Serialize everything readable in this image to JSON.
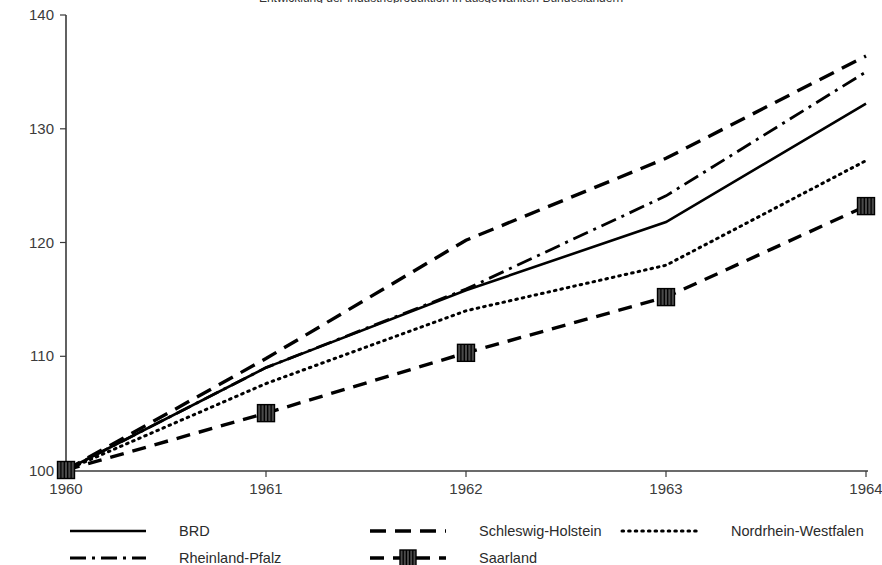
{
  "chart_data": {
    "type": "line",
    "title": "Entwicklung der Industrieproduktion in ausgewählten Bundesländern",
    "xlabel": "",
    "ylabel": "",
    "x": [
      1960,
      1961,
      1962,
      1963,
      1964
    ],
    "categories": [
      "1960",
      "1961",
      "1962",
      "1963",
      "1964"
    ],
    "xticklabels": [
      "1960",
      "1961",
      "1962",
      "1963",
      "1964"
    ],
    "yticklabels": [
      "100",
      "110",
      "120",
      "130",
      "140"
    ],
    "yticks": [
      100,
      110,
      120,
      130,
      140
    ],
    "ylim": [
      100,
      140
    ],
    "xlim": [
      1960,
      1964
    ],
    "grid": false,
    "legend_position": "bottom",
    "series": [
      {
        "name": "BRD",
        "style": "solid",
        "marker": "none",
        "color": "#000000",
        "values": [
          100,
          109.0,
          115.8,
          121.8,
          132.2
        ]
      },
      {
        "name": "Schleswig-Holstein",
        "style": "dashed",
        "marker": "none",
        "color": "#000000",
        "values": [
          100,
          109.8,
          120.2,
          127.4,
          136.4
        ]
      },
      {
        "name": "Nordrhein-Westfalen",
        "style": "dotted",
        "marker": "none",
        "color": "#000000",
        "values": [
          100,
          107.6,
          114.0,
          118.0,
          127.2
        ]
      },
      {
        "name": "Rheinland-Pfalz",
        "style": "dashdot",
        "marker": "none",
        "color": "#000000",
        "values": [
          100,
          109.0,
          115.9,
          124.1,
          135.0
        ]
      },
      {
        "name": "Saarland",
        "style": "dashed",
        "marker": "square",
        "color": "#000000",
        "values": [
          100,
          105.0,
          110.3,
          115.2,
          123.2
        ]
      }
    ]
  },
  "legend": {
    "items": [
      {
        "label": "BRD",
        "style": "solid"
      },
      {
        "label": "Schleswig-Holstein",
        "style": "dashed"
      },
      {
        "label": "Nordrhein-Westfalen",
        "style": "dotted"
      },
      {
        "label": "Rheinland-Pfalz",
        "style": "dashdot"
      },
      {
        "label": "Saarland",
        "style": "dashed-marker"
      }
    ]
  },
  "axes": {
    "y_tick_0": "100",
    "y_tick_1": "110",
    "y_tick_2": "120",
    "y_tick_3": "130",
    "y_tick_4": "140",
    "x_tick_0": "1960",
    "x_tick_1": "1961",
    "x_tick_2": "1962",
    "x_tick_3": "1963",
    "x_tick_4": "1964"
  },
  "colors": {
    "line": "#000000",
    "axis": "#3a3a3a",
    "text": "#2b2b2b",
    "background": "#ffffff"
  }
}
